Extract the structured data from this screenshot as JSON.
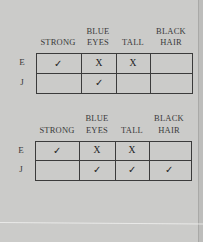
{
  "tables": [
    {
      "columns": [
        {
          "line1": "",
          "line2": "STRONG"
        },
        {
          "line1": "BLUE",
          "line2": "EYES"
        },
        {
          "line1": "",
          "line2": "TALL"
        },
        {
          "line1": "BLACK",
          "line2": "HAIR"
        }
      ],
      "rows": [
        {
          "label": "E",
          "cells": [
            "✓",
            "X",
            "X",
            ""
          ]
        },
        {
          "label": "J",
          "cells": [
            "",
            "✓",
            "",
            ""
          ]
        }
      ]
    },
    {
      "columns": [
        {
          "line1": "",
          "line2": "STRONG"
        },
        {
          "line1": "BLUE",
          "line2": "EYES"
        },
        {
          "line1": "",
          "line2": "TALL"
        },
        {
          "line1": "BLACK",
          "line2": "HAIR"
        }
      ],
      "rows": [
        {
          "label": "E",
          "cells": [
            "✓",
            "X",
            "X",
            ""
          ]
        },
        {
          "label": "J",
          "cells": [
            "",
            "✓",
            "✓",
            "✓"
          ]
        }
      ]
    }
  ]
}
